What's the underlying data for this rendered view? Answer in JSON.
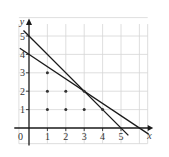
{
  "chart_data": {
    "type": "line",
    "title": "",
    "xlabel": "x",
    "ylabel": "y",
    "origin_label": "0",
    "xlim": [
      -0.8,
      6.6
    ],
    "ylim": [
      -0.9,
      6.0
    ],
    "x_ticks": [
      1,
      2,
      3,
      4,
      5
    ],
    "y_ticks": [
      1,
      2,
      3,
      4,
      5
    ],
    "grid": true,
    "series": [
      {
        "name": "x + y = 5",
        "x": [
          -0.3,
          5.4
        ],
        "y": [
          5.3,
          -0.4
        ]
      },
      {
        "name": "2x + 3y = 12",
        "x": [
          -0.5,
          6.5
        ],
        "y": [
          4.333,
          -0.333
        ]
      }
    ],
    "points": [
      {
        "x": 1,
        "y": 1
      },
      {
        "x": 1,
        "y": 2
      },
      {
        "x": 1,
        "y": 3
      },
      {
        "x": 2,
        "y": 1
      },
      {
        "x": 2,
        "y": 2
      },
      {
        "x": 3,
        "y": 1
      },
      {
        "x": 3,
        "y": 2
      },
      {
        "x": 4,
        "y": 1
      }
    ],
    "colors": {
      "grid": "#d6d6d6",
      "axes": "#1a1a1a",
      "lines": "#1a1a1a",
      "points": "#333333",
      "text": "#333333"
    }
  }
}
